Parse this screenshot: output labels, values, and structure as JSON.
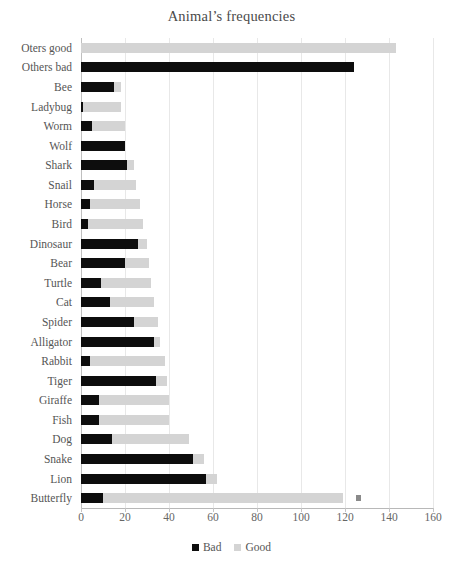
{
  "chart_data": {
    "type": "bar",
    "orientation": "horizontal",
    "stacked": true,
    "title": "Animal’s frequencies",
    "xlabel": "",
    "ylabel": "",
    "xlim": [
      0,
      160
    ],
    "xticks": [
      0,
      20,
      40,
      60,
      80,
      100,
      120,
      140,
      160
    ],
    "grid": "vertical",
    "legend_position": "bottom",
    "colors": {
      "bad": "#0d0d0d",
      "good": "#d4d4d4",
      "extra_marker": "#8a8a8a",
      "gridline": "#e8e8e8",
      "axis": "#b8b8b8",
      "text": "#555555",
      "background": "#ffffff"
    },
    "categories": [
      "Oters good",
      "Others bad",
      "Bee",
      "Ladybug",
      "Worm",
      "Wolf",
      "Shark",
      "Snail",
      "Horse",
      "Bird",
      "Dinosaur",
      "Bear",
      "Turtle",
      "Cat",
      "Spider",
      "Alligator",
      "Rabbit",
      "Tiger",
      "Giraffe",
      "Fish",
      "Dog",
      "Snake",
      "Lion",
      "Butterfly"
    ],
    "series": [
      {
        "name": "Bad",
        "color": "#0d0d0d",
        "values": [
          0,
          124,
          15,
          1,
          5,
          20,
          21,
          6,
          4,
          3,
          26,
          20,
          9,
          13,
          24,
          33,
          4,
          34,
          8,
          8,
          14,
          51,
          57,
          10
        ]
      },
      {
        "name": "Good",
        "color": "#d4d4d4",
        "values": [
          143,
          0,
          3,
          17,
          15,
          0,
          3,
          19,
          23,
          25,
          4,
          11,
          23,
          20,
          11,
          3,
          34,
          5,
          32,
          32,
          35,
          5,
          5,
          109
        ]
      }
    ],
    "totals": [
      143,
      124,
      18,
      18,
      20,
      20,
      24,
      25,
      27,
      28,
      30,
      31,
      32,
      33,
      35,
      36,
      38,
      39,
      40,
      40,
      49,
      56,
      62,
      119
    ],
    "annotations": [
      {
        "category": "Butterfly",
        "type": "marker",
        "x": 125,
        "note": "small detached gray marker right of the Butterfly bar"
      }
    ]
  },
  "legend": {
    "items": [
      {
        "label": "Bad",
        "color": "#0d0d0d"
      },
      {
        "label": "Good",
        "color": "#d4d4d4"
      }
    ]
  }
}
